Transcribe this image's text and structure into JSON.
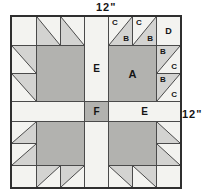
{
  "dimensions": {
    "top_label": "12\"",
    "right_label": "12\""
  },
  "colors": {
    "background": "#ffffff",
    "cell_bg": "#f3f3f0",
    "claw_fill": "#d3d3d1",
    "paw_fill": "#b2b2af",
    "grid_line": "#4a4a4a",
    "outer_border": "#2f2f2f",
    "text": "#151515"
  },
  "block": {
    "x": 10,
    "y": 15,
    "col_widths": [
      24,
      24,
      24,
      24,
      24,
      24,
      24
    ],
    "row_heights": [
      28,
      28,
      28,
      20,
      22,
      22,
      22
    ],
    "squares": [
      {
        "c": 0,
        "r": 0,
        "w": 1,
        "h": 1,
        "fill": "bg",
        "name": "corner-square"
      },
      {
        "c": 1,
        "r": 1,
        "w": 2,
        "h": 2,
        "fill": "paw",
        "name": "paw-square"
      },
      {
        "c": 3,
        "r": 0,
        "w": 1,
        "h": 3,
        "fill": "bg",
        "label": "E",
        "fs": 10,
        "ly": 62,
        "name": "sashing-strip-top"
      },
      {
        "c": 6,
        "r": 0,
        "w": 1,
        "h": 1,
        "fill": "bg",
        "label": "D",
        "fs": 9,
        "name": "corner-square-d"
      },
      {
        "c": 4,
        "r": 1,
        "w": 2,
        "h": 2,
        "fill": "paw",
        "label": "A",
        "fs": 11,
        "name": "paw-square-a"
      },
      {
        "c": 0,
        "r": 3,
        "w": 3,
        "h": 1,
        "fill": "bg",
        "name": "sashing-strip-left"
      },
      {
        "c": 3,
        "r": 3,
        "w": 1,
        "h": 1,
        "fill": "paw",
        "label": "F",
        "fs": 10,
        "name": "center-square-f"
      },
      {
        "c": 4,
        "r": 3,
        "w": 3,
        "h": 1,
        "fill": "bg",
        "label": "E",
        "fs": 10,
        "name": "sashing-strip-right"
      },
      {
        "c": 3,
        "r": 4,
        "w": 1,
        "h": 3,
        "fill": "bg",
        "name": "sashing-strip-bottom"
      },
      {
        "c": 1,
        "r": 4,
        "w": 2,
        "h": 2,
        "fill": "paw",
        "name": "paw-square"
      },
      {
        "c": 0,
        "r": 6,
        "w": 1,
        "h": 1,
        "fill": "bg",
        "name": "corner-square"
      },
      {
        "c": 4,
        "r": 4,
        "w": 2,
        "h": 2,
        "fill": "paw",
        "name": "paw-square"
      },
      {
        "c": 6,
        "r": 6,
        "w": 1,
        "h": 1,
        "fill": "bg",
        "name": "corner-square"
      }
    ],
    "hsts": [
      {
        "c": 1,
        "r": 0,
        "gray": "bl"
      },
      {
        "c": 2,
        "r": 0,
        "gray": "bl"
      },
      {
        "c": 0,
        "r": 1,
        "gray": "tr"
      },
      {
        "c": 0,
        "r": 2,
        "gray": "tr"
      },
      {
        "c": 4,
        "r": 0,
        "gray": "br",
        "labels": {
          "tl": "C",
          "br": "B"
        }
      },
      {
        "c": 5,
        "r": 0,
        "gray": "br",
        "labels": {
          "tl": "C",
          "br": "B"
        }
      },
      {
        "c": 6,
        "r": 1,
        "gray": "tl",
        "labels": {
          "tl": "B",
          "br": "C"
        }
      },
      {
        "c": 6,
        "r": 2,
        "gray": "tl",
        "labels": {
          "tl": "B",
          "br": "C"
        }
      },
      {
        "c": 0,
        "r": 4,
        "gray": "br"
      },
      {
        "c": 0,
        "r": 5,
        "gray": "br"
      },
      {
        "c": 1,
        "r": 6,
        "gray": "tl"
      },
      {
        "c": 2,
        "r": 6,
        "gray": "tl"
      },
      {
        "c": 6,
        "r": 4,
        "gray": "bl"
      },
      {
        "c": 6,
        "r": 5,
        "gray": "bl"
      },
      {
        "c": 4,
        "r": 6,
        "gray": "tr"
      },
      {
        "c": 5,
        "r": 6,
        "gray": "tr"
      }
    ]
  }
}
